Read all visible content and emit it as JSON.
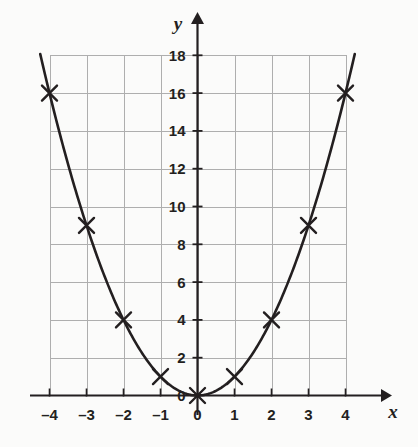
{
  "chart_data": {
    "type": "line",
    "title": "",
    "subtitle": "",
    "xlabel": "x",
    "ylabel": "y",
    "function": "y = x^2",
    "grid": true,
    "legend": null,
    "xlim": [
      -4,
      4
    ],
    "ylim": [
      0,
      18
    ],
    "xticks": [
      -4,
      -3,
      -2,
      -1,
      0,
      1,
      2,
      3,
      4
    ],
    "yticks": [
      0,
      2,
      4,
      6,
      8,
      10,
      12,
      14,
      16,
      18
    ],
    "xtick_labels": [
      "–4",
      "–3",
      "–2",
      "–1",
      "0",
      "1",
      "2",
      "3",
      "4"
    ],
    "ytick_labels": [
      "0",
      "2",
      "4",
      "6",
      "8",
      "10",
      "12",
      "14",
      "16",
      "18"
    ],
    "marker": "x-cross",
    "x": [
      -4,
      -3,
      -2,
      -1,
      0,
      1,
      2,
      3,
      4
    ],
    "values": [
      16,
      9,
      4,
      1,
      0,
      1,
      4,
      9,
      16
    ],
    "points": [
      {
        "x": -4,
        "y": 16
      },
      {
        "x": -3,
        "y": 9
      },
      {
        "x": -2,
        "y": 4
      },
      {
        "x": -1,
        "y": 1
      },
      {
        "x": 0,
        "y": 0
      },
      {
        "x": 1,
        "y": 1
      },
      {
        "x": 2,
        "y": 4
      },
      {
        "x": 3,
        "y": 9
      },
      {
        "x": 4,
        "y": 16
      }
    ],
    "colors": {
      "background": "#fbfbfa",
      "grid": "#aeaeae",
      "axis": "#231f20",
      "curve": "#231f20",
      "marker": "#231f20",
      "text": "#231f20"
    },
    "axis_arrows": {
      "x": "right",
      "y": "up"
    }
  }
}
